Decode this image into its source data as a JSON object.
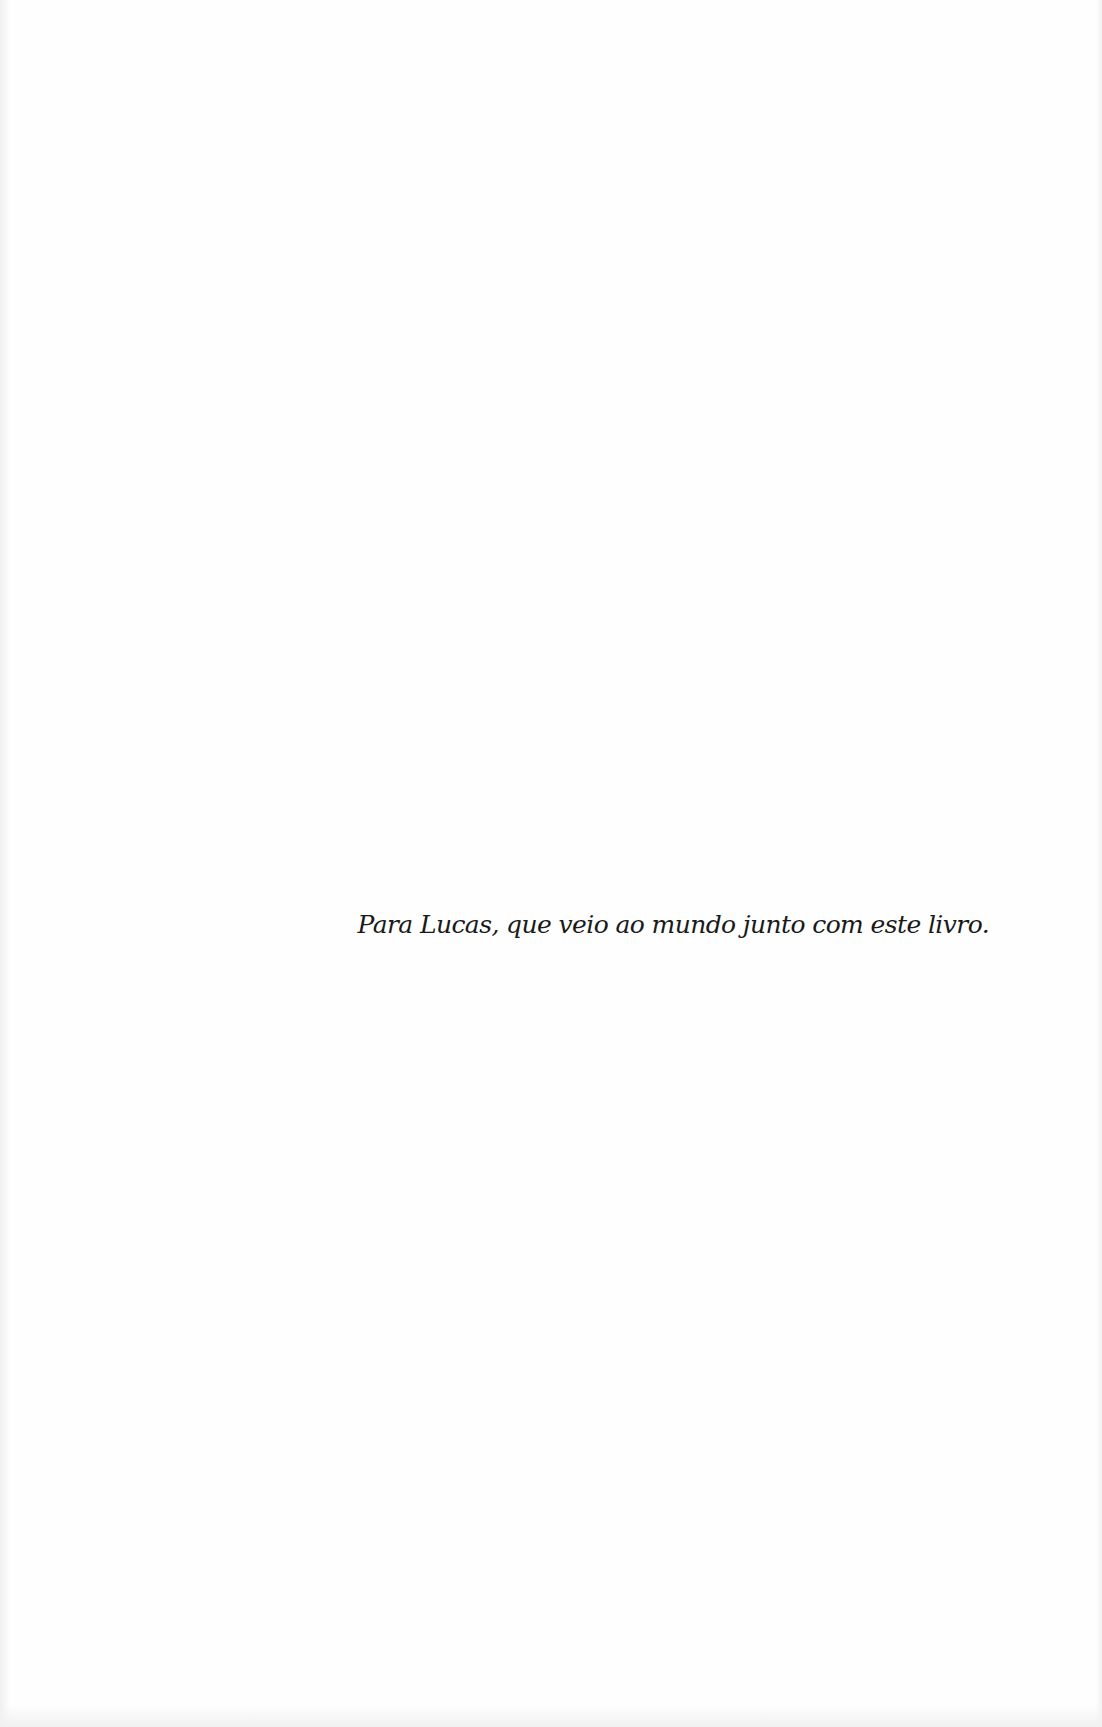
{
  "page": {
    "type": "book-dedication-page",
    "background_color": "#fefefe",
    "text_color": "#1a1a1a"
  },
  "dedication": {
    "text": "Para Lucas, que veio ao mundo junto com este livro."
  }
}
